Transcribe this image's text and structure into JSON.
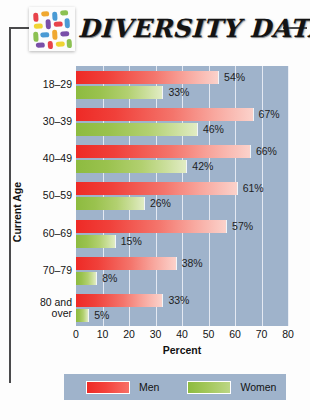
{
  "header": {
    "title": "DIVERSITY DATA",
    "logo_icon": "confetti-tile-icon"
  },
  "chart_data": {
    "type": "bar",
    "orientation": "horizontal",
    "title": "DIVERSITY DATA",
    "xlabel": "Percent",
    "ylabel": "Current Age",
    "xlim": [
      0,
      80
    ],
    "xticks": [
      0,
      10,
      20,
      30,
      40,
      50,
      60,
      70,
      80
    ],
    "grid": true,
    "legend_position": "bottom",
    "plot_background": "#9fb3cb",
    "categories": [
      "18–29",
      "30–39",
      "40–49",
      "50–59",
      "60–69",
      "70–79",
      "80 and over"
    ],
    "series": [
      {
        "name": "Men",
        "color": "#ee2a26",
        "values": [
          54,
          67,
          66,
          61,
          57,
          38,
          33
        ],
        "labels": [
          "54%",
          "67%",
          "66%",
          "61%",
          "57%",
          "38%",
          "33%"
        ]
      },
      {
        "name": "Women",
        "color": "#8dbb40",
        "values": [
          33,
          46,
          42,
          26,
          15,
          8,
          5
        ],
        "labels": [
          "33%",
          "46%",
          "42%",
          "26%",
          "15%",
          "8%",
          "5%"
        ]
      }
    ]
  },
  "legend": {
    "items": [
      {
        "label": "Men",
        "color": "#ee2a26"
      },
      {
        "label": "Women",
        "color": "#8dbb40"
      }
    ]
  }
}
